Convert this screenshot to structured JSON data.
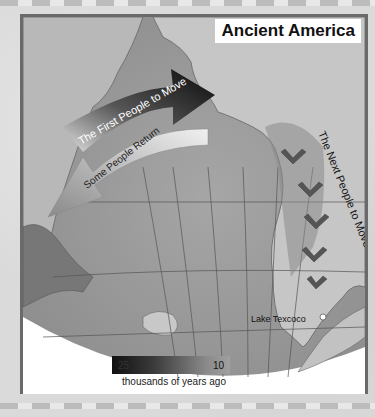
{
  "map": {
    "title": "Ancient America",
    "labels": {
      "first_people": "The First People to Move",
      "some_return": "Some People Return",
      "next_people": "The Next People to Move",
      "lake": "Lake Texcoco"
    },
    "legend": {
      "start_value": "25",
      "end_value": "10",
      "caption": "thousands of years ago"
    },
    "colors": {
      "ocean": "#9c9c9c",
      "land": "#bdbdbd",
      "dark_land": "#7a7a7a",
      "arrow_dark": "#111111",
      "arrow_light": "#d8d8d8",
      "frame": "#6a6a6a"
    }
  }
}
